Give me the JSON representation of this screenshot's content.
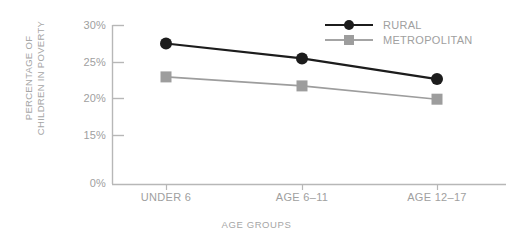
{
  "chart_data": {
    "type": "line",
    "title": "",
    "xlabel": "AGE GROUPS",
    "ylabel": "PERCENTAGE OF CHILDREN IN POVERTY",
    "ylabel_lines": [
      "PERCENTAGE OF",
      "CHILDREN IN POVERTY"
    ],
    "categories": [
      "UNDER 6",
      "AGE 6–11",
      "AGE 12–17"
    ],
    "ytick_labels": [
      "30%",
      "25%",
      "20%",
      "15%",
      "0%"
    ],
    "ytick_values": [
      30,
      25,
      20,
      15,
      0
    ],
    "ylim": [
      0,
      31
    ],
    "grid": false,
    "legend_position": "top-right",
    "series": [
      {
        "name": "RURAL",
        "values": [
          26.5,
          23.7,
          19.8
        ],
        "color": "#1c1c1c",
        "marker": "circle"
      },
      {
        "name": "METROPOLITAN",
        "values": [
          20.2,
          18.5,
          16.0
        ],
        "color": "#9d9d9d",
        "marker": "square"
      }
    ]
  },
  "legend": {
    "entries": [
      {
        "label": "RURAL"
      },
      {
        "label": "METROPOLITAN"
      }
    ]
  },
  "colors": {
    "rural": "#1c1c1c",
    "metropolitan": "#9d9d9d",
    "axis": "#b3b3b3",
    "text": "#a0a0a0",
    "background": "#ffffff"
  }
}
